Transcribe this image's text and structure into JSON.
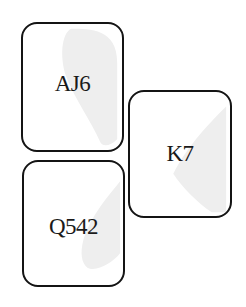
{
  "hands": [
    {
      "position": "north",
      "cards": "AJ6",
      "suit": "spade-watermark"
    },
    {
      "position": "east",
      "cards": "K7",
      "suit": "spade-watermark"
    },
    {
      "position": "south",
      "cards": "Q542",
      "suit": "spade-watermark"
    }
  ],
  "colors": {
    "border": "#141414",
    "text": "#1a1a1a",
    "watermark": "#ececec"
  }
}
